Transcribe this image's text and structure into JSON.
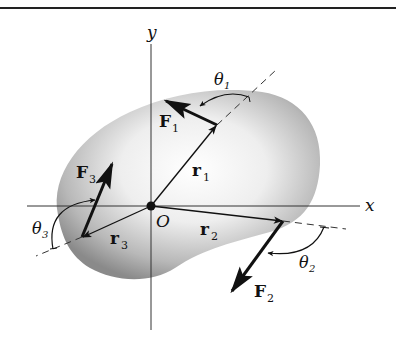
{
  "figure": {
    "axes": {
      "x_label": "x",
      "y_label": "y",
      "origin_label": "O"
    },
    "vectors": {
      "r1": {
        "label": "r",
        "sub": "1"
      },
      "r2": {
        "label": "r",
        "sub": "2"
      },
      "r3": {
        "label": "r",
        "sub": "3"
      }
    },
    "forces": {
      "F1": {
        "label": "F",
        "sub": "1"
      },
      "F2": {
        "label": "F",
        "sub": "2"
      },
      "F3": {
        "label": "F",
        "sub": "3"
      }
    },
    "angles": {
      "theta1": {
        "label": "θ",
        "sub": "1"
      },
      "theta2": {
        "label": "θ",
        "sub": "2"
      },
      "theta3": {
        "label": "θ",
        "sub": "3"
      }
    },
    "colors": {
      "line": "#111111",
      "body_light": "#f4f4f4",
      "body_dark": "#8a8a8a"
    }
  }
}
